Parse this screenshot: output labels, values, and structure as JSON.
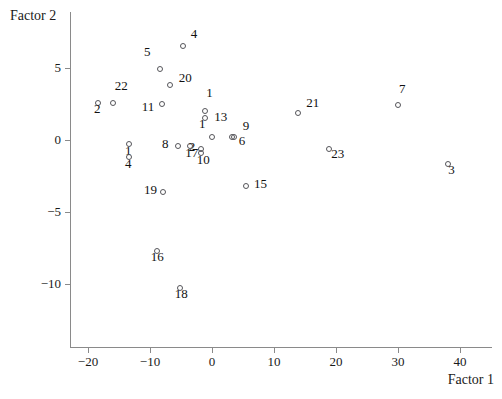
{
  "chart_data": {
    "type": "scatter",
    "title": "",
    "xlabel": "Factor 1",
    "ylabel": "Factor 2",
    "xlim": [
      -23.0,
      45.0
    ],
    "ylim": [
      -13.5,
      8.5
    ],
    "xticks": [
      -20,
      -10,
      0,
      10,
      20,
      30,
      40
    ],
    "yticks": [
      5,
      0,
      -5,
      -10
    ],
    "xtick_labels": [
      "−20",
      "−10",
      "0",
      "10",
      "20",
      "30",
      "40"
    ],
    "ytick_labels": [
      "5",
      "0",
      "−5",
      "−10"
    ],
    "grid": false,
    "legend": null,
    "marker": "open-circle",
    "points": [
      {
        "label": "4",
        "x": -4.7,
        "y": 6.5,
        "label_dx": 8,
        "label_dy": -13
      },
      {
        "label": "5",
        "x": -8.4,
        "y": 4.9,
        "label_dx": -16,
        "label_dy": -18
      },
      {
        "label": "20",
        "x": -6.8,
        "y": 3.8,
        "label_dx": 9,
        "label_dy": -8
      },
      {
        "label": "22",
        "x": -16.0,
        "y": 2.6,
        "label_dx": 2,
        "label_dy": -18
      },
      {
        "label": "2",
        "x": -18.4,
        "y": 2.6,
        "label_dx": -4,
        "label_dy": 5
      },
      {
        "label": "11",
        "x": -8.1,
        "y": 2.5,
        "label_dx": -20,
        "label_dy": 2
      },
      {
        "label": "1",
        "x": -1.1,
        "y": 2.0,
        "label_dx": 1,
        "label_dy": -19
      },
      {
        "label": "13",
        "x": -1.1,
        "y": 1.5,
        "label_dx": 9,
        "label_dy": -2
      },
      {
        "label": "21",
        "x": 13.9,
        "y": 1.9,
        "label_dx": 8,
        "label_dy": -11
      },
      {
        "label": "7",
        "x": 30.0,
        "y": 2.4,
        "label_dx": 1,
        "label_dy": -17
      },
      {
        "label": "1",
        "x": 0.0,
        "y": 0.2,
        "label_dx": -13,
        "label_dy": -14
      },
      {
        "label": "9",
        "x": 3.5,
        "y": 0.2,
        "label_dx": 9,
        "label_dy": -12
      },
      {
        "label": "6",
        "x": 3.2,
        "y": 0.2,
        "label_dx": 7,
        "label_dy": 3
      },
      {
        "label": "23",
        "x": 18.9,
        "y": -0.6,
        "label_dx": 2,
        "label_dy": 4
      },
      {
        "label": "1",
        "x": -13.4,
        "y": -0.3,
        "label_dx": -4,
        "label_dy": 6
      },
      {
        "label": "4",
        "x": -13.4,
        "y": -1.2,
        "label_dx": -4,
        "label_dy": 6
      },
      {
        "label": "8",
        "x": -5.5,
        "y": -0.4,
        "label_dx": -16,
        "label_dy": -3
      },
      {
        "label": "17",
        "x": -3.5,
        "y": -0.4,
        "label_dx": -5,
        "label_dy": 6
      },
      {
        "label": "2",
        "x": -1.8,
        "y": -0.6,
        "label_dx": -12,
        "label_dy": -3
      },
      {
        "label": "10",
        "x": -1.8,
        "y": -0.9,
        "label_dx": -4,
        "label_dy": 6
      },
      {
        "label": "3",
        "x": 38.1,
        "y": -1.7,
        "label_dx": 0,
        "label_dy": 5
      },
      {
        "label": "15",
        "x": 5.5,
        "y": -3.2,
        "label_dx": 8,
        "label_dy": -3
      },
      {
        "label": "19",
        "x": -7.9,
        "y": -3.6,
        "label_dx": -19,
        "label_dy": -3
      },
      {
        "label": "16",
        "x": -8.9,
        "y": -7.7,
        "label_dx": -6,
        "label_dy": 5
      },
      {
        "label": "18",
        "x": -5.2,
        "y": -10.3,
        "label_dx": -5,
        "label_dy": 5
      }
    ]
  }
}
